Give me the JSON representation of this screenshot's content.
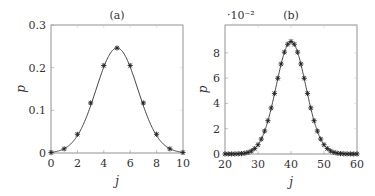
{
  "chart_data": [
    {
      "type": "line",
      "title": "(a)",
      "xlabel": "j",
      "ylabel": "p",
      "xlim": [
        0,
        10
      ],
      "ylim": [
        0,
        0.3
      ],
      "xticks": [
        "0",
        "2",
        "4",
        "6",
        "8",
        "10"
      ],
      "yticks": [
        "0",
        "0.1",
        "0.2",
        "0.3"
      ],
      "grid": false,
      "series": [
        {
          "name": "curve",
          "style": "solid line"
        },
        {
          "name": "markers",
          "style": "asterisk",
          "x": [
            0,
            1,
            2,
            3,
            4,
            5,
            6,
            7,
            8,
            9,
            10
          ],
          "values": [
            0.001,
            0.0098,
            0.0439,
            0.1172,
            0.2051,
            0.2461,
            0.2051,
            0.1172,
            0.0439,
            0.0098,
            0.001
          ]
        }
      ]
    },
    {
      "type": "line",
      "title": "(b)",
      "xlabel": "j",
      "ylabel": "p",
      "y_multiplier": "·10⁻²",
      "xlim": [
        20,
        60
      ],
      "ylim": [
        0,
        10.2
      ],
      "xticks": [
        "20",
        "30",
        "40",
        "50",
        "60"
      ],
      "yticks": [
        "0",
        "2",
        "4",
        "6",
        "8"
      ],
      "grid": false,
      "series": [
        {
          "name": "curve",
          "style": "solid line"
        },
        {
          "name": "markers",
          "style": "asterisk",
          "x_range": [
            20,
            60
          ],
          "peak": 8.89,
          "center": 40
        }
      ]
    }
  ]
}
